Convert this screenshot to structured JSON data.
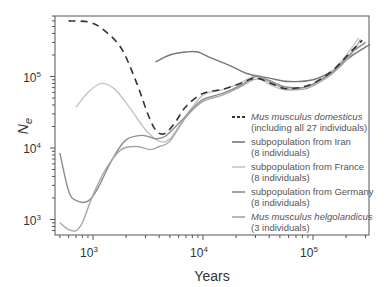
{
  "chart_data": {
    "type": "line",
    "title": "",
    "xlabel": "Years",
    "ylabel": "Ne",
    "xscale": "log",
    "yscale": "log",
    "xlim": [
      450,
      330000
    ],
    "ylim": [
      650,
      700000
    ],
    "x_ticks": [
      {
        "label": "10",
        "exp": "3",
        "value": 1000
      },
      {
        "label": "10",
        "exp": "4",
        "value": 10000
      },
      {
        "label": "10",
        "exp": "5",
        "value": 100000
      }
    ],
    "y_ticks": [
      {
        "label": "10",
        "exp": "3",
        "value": 1000
      },
      {
        "label": "10",
        "exp": "4",
        "value": 10000
      },
      {
        "label": "10",
        "exp": "5",
        "value": 100000
      }
    ],
    "grid": false,
    "legend_position": "lower right",
    "series": [
      {
        "name": "Mus musculus domesticus",
        "detail": "(including all 27 individuals)",
        "italic": true,
        "style": "dashed",
        "color": "#333333",
        "points": [
          [
            600,
            600000
          ],
          [
            900,
            580000
          ],
          [
            1200,
            470000
          ],
          [
            1800,
            250000
          ],
          [
            2500,
            80000
          ],
          [
            3200,
            28000
          ],
          [
            3800,
            17000
          ],
          [
            4500,
            16000
          ],
          [
            5500,
            22000
          ],
          [
            7000,
            38000
          ],
          [
            10000,
            58000
          ],
          [
            15000,
            66000
          ],
          [
            22000,
            80000
          ],
          [
            30000,
            95000
          ],
          [
            40000,
            82000
          ],
          [
            55000,
            68000
          ],
          [
            75000,
            70000
          ],
          [
            100000,
            80000
          ],
          [
            150000,
            120000
          ],
          [
            220000,
            220000
          ],
          [
            280000,
            320000
          ]
        ]
      },
      {
        "name": "subpopulation from Iran",
        "detail": "(8 individuals)",
        "italic": false,
        "style": "solid",
        "color": "#777777",
        "points": [
          [
            3700,
            160000
          ],
          [
            5000,
            200000
          ],
          [
            7000,
            220000
          ],
          [
            9000,
            220000
          ],
          [
            12000,
            180000
          ],
          [
            18000,
            140000
          ],
          [
            25000,
            110000
          ],
          [
            40000,
            95000
          ],
          [
            60000,
            85000
          ],
          [
            100000,
            90000
          ],
          [
            150000,
            120000
          ],
          [
            220000,
            190000
          ],
          [
            330000,
            280000
          ]
        ]
      },
      {
        "name": "subpopulation from France",
        "detail": "(8 individuals)",
        "italic": false,
        "style": "solid",
        "color": "#c4c4c4",
        "points": [
          [
            700,
            37000
          ],
          [
            900,
            60000
          ],
          [
            1200,
            80000
          ],
          [
            1600,
            65000
          ],
          [
            2200,
            35000
          ],
          [
            3000,
            18000
          ],
          [
            4000,
            12500
          ],
          [
            5000,
            13500
          ],
          [
            7000,
            28000
          ],
          [
            10000,
            55000
          ],
          [
            15000,
            65000
          ],
          [
            22000,
            82000
          ],
          [
            30000,
            100000
          ],
          [
            40000,
            78000
          ],
          [
            55000,
            65000
          ],
          [
            75000,
            68000
          ],
          [
            100000,
            78000
          ],
          [
            150000,
            120000
          ],
          [
            220000,
            240000
          ],
          [
            260000,
            350000
          ]
        ]
      },
      {
        "name": "subpopulation from Germany",
        "detail": "(8 individuals)",
        "italic": false,
        "style": "solid",
        "color": "#8c8c8c",
        "points": [
          [
            500,
            8500
          ],
          [
            600,
            2500
          ],
          [
            700,
            1850
          ],
          [
            900,
            1800
          ],
          [
            1100,
            2700
          ],
          [
            1500,
            7000
          ],
          [
            2000,
            13000
          ],
          [
            2800,
            15000
          ],
          [
            3700,
            13500
          ],
          [
            4500,
            14500
          ],
          [
            6000,
            22000
          ],
          [
            8000,
            35000
          ],
          [
            10000,
            48000
          ],
          [
            15000,
            58000
          ],
          [
            22000,
            75000
          ],
          [
            30000,
            100000
          ],
          [
            40000,
            88000
          ],
          [
            55000,
            72000
          ],
          [
            80000,
            70000
          ],
          [
            100000,
            78000
          ],
          [
            150000,
            115000
          ],
          [
            220000,
            210000
          ],
          [
            300000,
            300000
          ]
        ]
      },
      {
        "name": "Mus musculus helgolandicus",
        "detail": "(3 individuals)",
        "italic": true,
        "style": "solid",
        "color": "#a6a6a6",
        "points": [
          [
            500,
            900
          ],
          [
            600,
            720
          ],
          [
            700,
            700
          ],
          [
            800,
            900
          ],
          [
            1000,
            2200
          ],
          [
            1300,
            5000
          ],
          [
            1800,
            9500
          ],
          [
            2500,
            10500
          ],
          [
            3300,
            9500
          ],
          [
            4000,
            10500
          ],
          [
            5000,
            12500
          ],
          [
            7000,
            27000
          ],
          [
            10000,
            45000
          ],
          [
            15000,
            55000
          ],
          [
            22000,
            72000
          ],
          [
            30000,
            92000
          ],
          [
            40000,
            85000
          ],
          [
            55000,
            68000
          ],
          [
            80000,
            66000
          ],
          [
            100000,
            74000
          ],
          [
            150000,
            110000
          ],
          [
            220000,
            200000
          ],
          [
            270000,
            330000
          ]
        ]
      }
    ]
  }
}
